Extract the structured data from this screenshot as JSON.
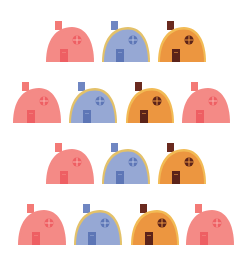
{
  "scene": {
    "background": "#ffffff",
    "description": "Rows of small dome-shaped houses in pink, blue and orange"
  },
  "palettes": {
    "pink": {
      "body": "#f48a86",
      "rim": "#f48a86",
      "chimney": "#f37a76",
      "door": "#ee5f63",
      "window": "#ee5f63",
      "window_line": "#f9b3ae"
    },
    "blue": {
      "body": "#96a8d4",
      "rim": "#e3c169",
      "chimney": "#6f86c2",
      "door": "#5d76b6",
      "window": "#5d76b6",
      "window_line": "#b5c3e4"
    },
    "orange": {
      "body": "#ec9640",
      "rim": "#f2bb55",
      "chimney": "#6a2a1f",
      "door": "#5c2319",
      "window": "#5c2319",
      "window_line": "#ec9640"
    }
  },
  "rows": [
    {
      "label": "row-1",
      "houses": [
        {
          "color": "pink",
          "x": 45,
          "y": 21
        },
        {
          "color": "blue",
          "x": 101,
          "y": 21
        },
        {
          "color": "orange",
          "x": 157,
          "y": 21
        }
      ]
    },
    {
      "label": "row-2",
      "houses": [
        {
          "color": "pink",
          "x": 12,
          "y": 82
        },
        {
          "color": "blue",
          "x": 68,
          "y": 82
        },
        {
          "color": "orange",
          "x": 125,
          "y": 82
        },
        {
          "color": "pink",
          "x": 181,
          "y": 82
        }
      ]
    },
    {
      "label": "row-3",
      "houses": [
        {
          "color": "pink",
          "x": 45,
          "y": 143
        },
        {
          "color": "blue",
          "x": 101,
          "y": 143
        },
        {
          "color": "orange",
          "x": 157,
          "y": 143
        }
      ]
    },
    {
      "label": "row-4",
      "houses": [
        {
          "color": "pink",
          "x": 17,
          "y": 204
        },
        {
          "color": "blue",
          "x": 73,
          "y": 204
        },
        {
          "color": "orange",
          "x": 130,
          "y": 204
        },
        {
          "color": "pink",
          "x": 185,
          "y": 204
        }
      ]
    }
  ]
}
